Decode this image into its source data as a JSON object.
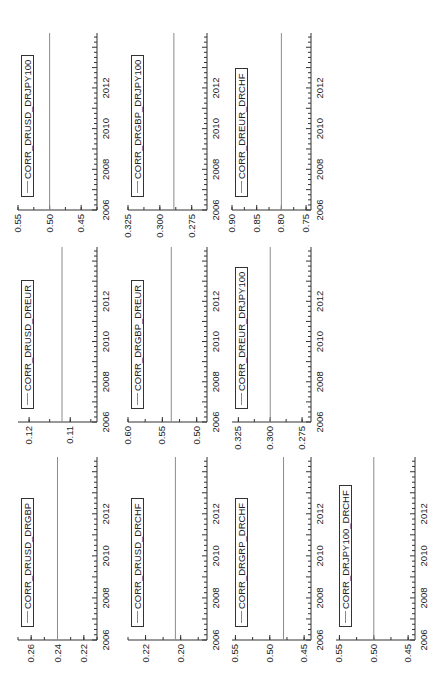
{
  "figure": {
    "orientation": "rotated 90 degrees counter-clockwise",
    "layout": "3 columns x 4 rows (right column has 3 charts, middle 3, left 4)"
  },
  "chart_data": [
    {
      "id": "c1",
      "type": "line",
      "title": "",
      "legend": "CORR_DRUSD_DRGBP",
      "xlabel": "",
      "ylabel": "",
      "x_ticks": [
        "2006",
        "2008",
        "2010",
        "2012"
      ],
      "xlim": [
        2006,
        2014.7
      ],
      "y_ticks": [
        0.26,
        0.24,
        0.22
      ],
      "y_tick_labels": [
        "0.26",
        "0.24",
        "0.22"
      ],
      "ylim": [
        0.21,
        0.27
      ],
      "series": [
        {
          "name": "CORR_DRUSD_DRGBP",
          "x": [
            2006,
            2014.7
          ],
          "values": [
            0.24,
            0.24
          ]
        }
      ],
      "grid": false,
      "col": 0,
      "row": 0
    },
    {
      "id": "c2",
      "type": "line",
      "title": "",
      "legend": "CORR_DRUSD_DRCHF",
      "xlabel": "",
      "ylabel": "",
      "x_ticks": [
        "2006",
        "2008",
        "2010",
        "2012"
      ],
      "xlim": [
        2006,
        2014.7
      ],
      "y_ticks": [
        0.22,
        0.2
      ],
      "y_tick_labels": [
        "0.22",
        "0.20"
      ],
      "ylim": [
        0.185,
        0.23
      ],
      "series": [
        {
          "name": "CORR_DRUSD_DRCHF",
          "x": [
            2006,
            2014.7
          ],
          "values": [
            0.203,
            0.203
          ]
        }
      ],
      "grid": false,
      "col": 0,
      "row": 1
    },
    {
      "id": "c3",
      "type": "line",
      "title": "",
      "legend": "CORR_DRGRP_DRCHF",
      "xlabel": "",
      "ylabel": "",
      "x_ticks": [
        "2006",
        "2008",
        "2010",
        "2012"
      ],
      "xlim": [
        2006,
        2014.7
      ],
      "y_ticks": [
        0.55,
        0.5,
        0.45
      ],
      "y_tick_labels": [
        "0.55",
        "0.50",
        "0.45"
      ],
      "ylim": [
        0.44,
        0.555
      ],
      "series": [
        {
          "name": "CORR_DRGRP_DRCHF",
          "x": [
            2006,
            2014.7
          ],
          "values": [
            0.48,
            0.48
          ]
        }
      ],
      "grid": false,
      "col": 0,
      "row": 2
    },
    {
      "id": "c4",
      "type": "line",
      "title": "",
      "legend": "CORR_DRJPY100_DRCHF",
      "xlabel": "",
      "ylabel": "",
      "x_ticks": [
        "2006",
        "2008",
        "2010",
        "2012"
      ],
      "xlim": [
        2006,
        2014.7
      ],
      "y_ticks": [
        0.55,
        0.5,
        0.45
      ],
      "y_tick_labels": [
        "0.55",
        "0.50",
        "0.45"
      ],
      "ylim": [
        0.44,
        0.555
      ],
      "series": [
        {
          "name": "CORR_DRJPY100_DRCHF",
          "x": [
            2006,
            2014.7
          ],
          "values": [
            0.5,
            0.5
          ]
        }
      ],
      "grid": false,
      "col": 0,
      "row": 3
    },
    {
      "id": "c5",
      "type": "line",
      "title": "",
      "legend": "CORR_DRUSD_DREUR",
      "xlabel": "",
      "ylabel": "",
      "x_ticks": [
        "2006",
        "2008",
        "2010",
        "2012"
      ],
      "xlim": [
        2006,
        2014.7
      ],
      "y_ticks": [
        0.12,
        0.11
      ],
      "y_tick_labels": [
        "0.12",
        "0.11"
      ],
      "ylim": [
        0.1035,
        0.1227
      ],
      "series": [
        {
          "name": "CORR_DRUSD_DREUR",
          "x": [
            2006,
            2014.7
          ],
          "values": [
            0.112,
            0.112
          ]
        }
      ],
      "grid": false,
      "col": 1,
      "row": 0
    },
    {
      "id": "c6",
      "type": "line",
      "title": "",
      "legend": "CORR_DRGBP_DREUR",
      "xlabel": "",
      "ylabel": "",
      "x_ticks": [
        "2006",
        "2008",
        "2010",
        "2012"
      ],
      "xlim": [
        2006,
        2014.7
      ],
      "y_ticks": [
        0.6,
        0.55,
        0.5
      ],
      "y_tick_labels": [
        "0.60",
        "0.55",
        "0.50"
      ],
      "ylim": [
        0.485,
        0.6
      ],
      "series": [
        {
          "name": "CORR_DRGBP_DREUR",
          "x": [
            2006,
            2014.7
          ],
          "values": [
            0.537,
            0.537
          ]
        }
      ],
      "grid": false,
      "col": 1,
      "row": 1
    },
    {
      "id": "c7",
      "type": "line",
      "title": "",
      "legend": "CORR_DREUR_DRJPY100",
      "xlabel": "",
      "ylabel": "",
      "x_ticks": [
        "2006",
        "2008",
        "2010",
        "2012"
      ],
      "xlim": [
        2006,
        2014.7
      ],
      "y_ticks": [
        0.325,
        0.3,
        0.275
      ],
      "y_tick_labels": [
        "0.325",
        "0.300",
        "0.275"
      ],
      "ylim": [
        0.268,
        0.33
      ],
      "series": [
        {
          "name": "CORR_DREUR_DRJPY100",
          "x": [
            2006,
            2014.7
          ],
          "values": [
            0.3,
            0.3
          ]
        }
      ],
      "grid": false,
      "col": 1,
      "row": 2
    },
    {
      "id": "c8",
      "type": "line",
      "title": "",
      "legend": "CORR_DRUSD_DRJPY100",
      "xlabel": "",
      "ylabel": "",
      "x_ticks": [
        "2006",
        "2008",
        "2010",
        "2012"
      ],
      "xlim": [
        2006,
        2014.7
      ],
      "y_ticks": [
        0.55,
        0.5,
        0.45
      ],
      "y_tick_labels": [
        "0.55",
        "0.50",
        "0.45"
      ],
      "ylim": [
        0.425,
        0.55
      ],
      "series": [
        {
          "name": "CORR_DRUSD_DRJPY100",
          "x": [
            2006,
            2014.7
          ],
          "values": [
            0.5,
            0.5
          ]
        }
      ],
      "grid": false,
      "col": 2,
      "row": 0
    },
    {
      "id": "c9",
      "type": "line",
      "title": "",
      "legend": "CORR_DRGBP_DRJPY100",
      "xlabel": "",
      "ylabel": "",
      "x_ticks": [
        "2006",
        "2008",
        "2010",
        "2012"
      ],
      "xlim": [
        2006,
        2014.7
      ],
      "y_ticks": [
        0.325,
        0.3,
        0.275
      ],
      "y_tick_labels": [
        "0.325",
        "0.300",
        "0.275"
      ],
      "ylim": [
        0.263,
        0.325
      ],
      "series": [
        {
          "name": "CORR_DRGBP_DRJPY100",
          "x": [
            2006,
            2014.7
          ],
          "values": [
            0.289,
            0.289
          ]
        }
      ],
      "grid": false,
      "col": 2,
      "row": 1
    },
    {
      "id": "c10",
      "type": "line",
      "title": "",
      "legend": "CORR_DREUR_DRCHF",
      "xlabel": "",
      "ylabel": "",
      "x_ticks": [
        "2006",
        "2008",
        "2010",
        "2012"
      ],
      "xlim": [
        2006,
        2014.7
      ],
      "y_ticks": [
        0.9,
        0.85,
        0.8,
        0.75
      ],
      "y_tick_labels": [
        "0.90",
        "0.85",
        "0.80",
        "0.75"
      ],
      "ylim": [
        0.74,
        0.9
      ],
      "series": [
        {
          "name": "CORR_DREUR_DRCHF",
          "x": [
            2006,
            2014.7
          ],
          "values": [
            0.8,
            0.8
          ]
        }
      ],
      "grid": false,
      "col": 2,
      "row": 2
    }
  ],
  "colors": {
    "axis": "#333333",
    "series_line": "#8c8c8c",
    "text": "#222222",
    "background": "#ffffff"
  }
}
